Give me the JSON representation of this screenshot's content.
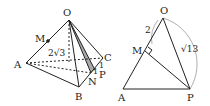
{
  "left_figure": {
    "labels": {
      "O": "O",
      "M": "M",
      "A": "A",
      "B": "B",
      "C": "C",
      "N": "N",
      "P": "P",
      "edge_OA": "2√3",
      "seg_CP": "1",
      "seg_PN": "1"
    }
  },
  "right_figure": {
    "labels": {
      "O": "O",
      "M": "M",
      "A": "A",
      "P": "P",
      "seg_OM": "2",
      "seg_OP": "√13"
    }
  }
}
